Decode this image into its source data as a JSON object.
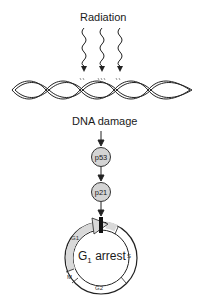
{
  "diagram": {
    "title_label": "Radiation",
    "damage_label": "DNA damage",
    "nodes": [
      {
        "id": "p53",
        "label": "p53"
      },
      {
        "id": "p21",
        "label": "p21"
      }
    ],
    "cell_cycle": {
      "center_label_main": "G",
      "center_label_sub": "1",
      "center_label_rest": " arrest",
      "phases": {
        "g1": "G1",
        "s": "S",
        "g2": "G2",
        "m": "M"
      }
    },
    "colors": {
      "node_fill": "#d4d4d4",
      "g1_fill": "#d9d9d9",
      "line": "#222222"
    }
  }
}
